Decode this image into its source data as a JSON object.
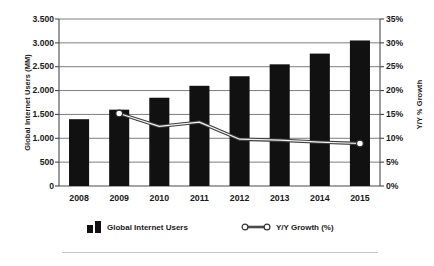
{
  "chart_data": {
    "type": "bar",
    "title": "",
    "xlabel": "",
    "ylabel": "Global Internet Users (MM)",
    "y2label": "Y/Y % Growth",
    "categories": [
      "2008",
      "2009",
      "2010",
      "2011",
      "2012",
      "2013",
      "2014",
      "2015"
    ],
    "grid": true,
    "legend_position": "bottom",
    "ylim": [
      0,
      3500
    ],
    "y2lim": [
      0,
      35
    ],
    "yticks": [
      "0",
      "500",
      "1.000",
      "1.500",
      "2.000",
      "2.500",
      "3.000",
      "3.500"
    ],
    "ytick_values": [
      0,
      500,
      1000,
      1500,
      2000,
      2500,
      3000,
      3500
    ],
    "y2ticks": [
      "0%",
      "5%",
      "10%",
      "15%",
      "20%",
      "25%",
      "30%",
      "35%"
    ],
    "y2tick_values": [
      0,
      5,
      10,
      15,
      20,
      25,
      30,
      35
    ],
    "series": [
      {
        "name": "Global Internet Users",
        "kind": "bar",
        "axis": "left",
        "color": "#111111",
        "values": [
          1400,
          1600,
          1850,
          2100,
          2300,
          2550,
          2775,
          3050
        ]
      },
      {
        "name": "Y/Y Growth (%)",
        "kind": "line",
        "axis": "right",
        "color": "#555555",
        "marker": "open-circle",
        "markers_shown": [
          "2009",
          "2015"
        ],
        "values": [
          null,
          15.2,
          12.5,
          13.4,
          9.8,
          9.6,
          9.2,
          8.9
        ]
      }
    ]
  },
  "legend": {
    "bars_label": "Global Internet Users",
    "line_label": "Y/Y Growth (%)"
  }
}
